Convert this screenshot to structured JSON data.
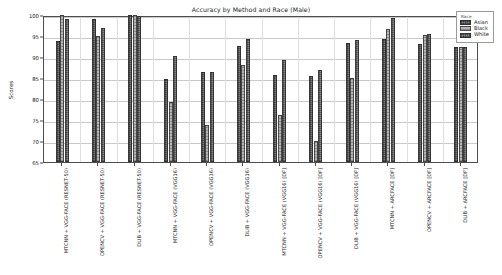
{
  "chart_data": {
    "type": "bar",
    "title": "Accuracy by Method and Race (Male)",
    "xlabel": "",
    "ylabel": "Scores",
    "ylim": [
      65,
      100
    ],
    "yticks": [
      65,
      70,
      75,
      80,
      85,
      90,
      95,
      100
    ],
    "grid": true,
    "legend_position": "upper right",
    "legend_title": "Race",
    "categories": [
      "MTCNN + VGG-FACE (RESNET-50)",
      "OPENCV + VGG-FACE (RESNET-50)",
      "DLIB + VGG-FACE (RESNET-50)",
      "MTCNN + VGG-FACE (VGG16)",
      "OPENCV + VGG-FACE (VGG16)",
      "DLIB + VGG-FACE (VGG16)",
      "MTCNN + VGG-FACE (VGG16) [DF]",
      "OPENCV + VGG-FACE (VGG16) [DF]",
      "DLIB + VGG-FACE (VGG16) [DF]",
      "MTCNN + ARCFACE [DF]",
      "OPENCV + ARCFACE [DF]",
      "DLIB + ARCFACE [DF]"
    ],
    "series": [
      {
        "name": "Asian",
        "color": "#7d7d7d",
        "values": [
          93.7,
          99.0,
          100.0,
          84.8,
          86.5,
          92.6,
          85.6,
          85.5,
          93.4,
          94.3,
          93.0,
          92.3
        ]
      },
      {
        "name": "Black",
        "color": "#b4b4b4",
        "values": [
          100.0,
          95.0,
          100.0,
          79.2,
          73.9,
          88.0,
          76.1,
          70.0,
          85.0,
          96.6,
          95.2,
          92.3
        ]
      },
      {
        "name": "White",
        "color": "#8a8a8a",
        "values": [
          99.0,
          97.0,
          99.7,
          90.3,
          86.4,
          94.2,
          89.4,
          86.9,
          94.1,
          99.3,
          95.4,
          92.3
        ]
      }
    ]
  }
}
